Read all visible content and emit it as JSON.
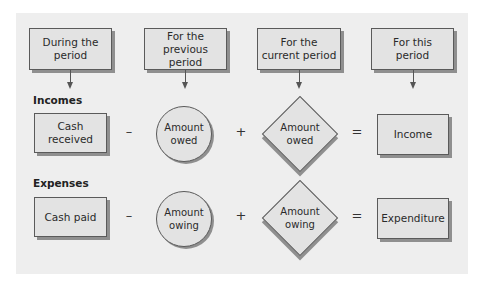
{
  "headers": [
    {
      "label_line1": "During the",
      "label_line2": "period"
    },
    {
      "label_line1": "For the",
      "label_line2": "previous period"
    },
    {
      "label_line1": "For the",
      "label_line2": "current period"
    },
    {
      "label_line1": "For this",
      "label_line2": "period"
    }
  ],
  "incomes": {
    "label": "Incomes",
    "cash": {
      "line1": "Cash",
      "line2": "received"
    },
    "op1": "–",
    "circle": {
      "line1": "Amount",
      "line2": "owed"
    },
    "op2": "+",
    "diamond": {
      "line1": "Amount",
      "line2": "owed"
    },
    "op3": "=",
    "result": "Income"
  },
  "expenses": {
    "label": "Expenses",
    "cash": "Cash paid",
    "op1": "–",
    "circle": {
      "line1": "Amount",
      "line2": "owing"
    },
    "op2": "+",
    "diamond": {
      "line1": "Amount",
      "line2": "owing"
    },
    "op3": "=",
    "result": "Expenditure"
  },
  "colors": {
    "panel": "#eeeeee",
    "shape_fill": "#e3e3e3",
    "border": "#5a5a5a",
    "shadow": "#8f8f8f"
  }
}
